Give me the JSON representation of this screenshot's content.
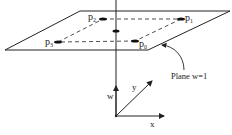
{
  "diagram": {
    "points": {
      "p0": {
        "label": "p",
        "sub": "0"
      },
      "p1": {
        "label": "p",
        "sub": "1"
      },
      "p2": {
        "label": "p",
        "sub": "2"
      },
      "p3": {
        "label": "p",
        "sub": "3"
      }
    },
    "plane_label": "Plane w=1",
    "axes": {
      "w": "w",
      "x": "x",
      "y": "y"
    },
    "colors": {
      "stroke": "#222222",
      "background": "#ffffff"
    }
  }
}
